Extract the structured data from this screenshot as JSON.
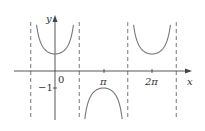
{
  "chart_data": {
    "type": "line",
    "title": "",
    "function": "y = sec x",
    "xlabel": "x",
    "ylabel": "y",
    "x_ticks": [
      {
        "label": "0",
        "value": 0
      },
      {
        "label": "π",
        "value": 3.14159
      },
      {
        "label": "2π",
        "value": 6.28318
      }
    ],
    "y_ticks": [
      {
        "label": "−1",
        "value": -1
      }
    ],
    "asymptotes": [
      -1.5708,
      1.5708,
      4.7124,
      7.854
    ],
    "xlim": [
      -1.6,
      7.9
    ],
    "ylim": [
      -2.9,
      2.9
    ],
    "grid": false,
    "series": [
      {
        "name": "sec x",
        "color": "#777777"
      }
    ]
  },
  "labels": {
    "y_axis": "y",
    "x_axis": "x",
    "origin": "0",
    "pi": "π",
    "two_pi": "2π",
    "minus_one": "−1"
  }
}
